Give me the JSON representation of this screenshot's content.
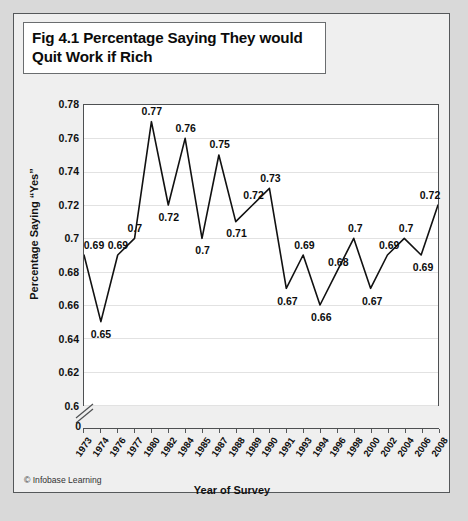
{
  "figure": {
    "title": "Fig 4.1 Percentage Saying They would Quit Work if Rich",
    "credit": "© Infobase Learning"
  },
  "chart_data": {
    "type": "line",
    "title": "Fig 4.1 Percentage Saying They would Quit Work if Rich",
    "xlabel": "Year of Survey",
    "ylabel": "Percentage Saying “Yes”",
    "categories": [
      "1973",
      "1974",
      "1976",
      "1977",
      "1980",
      "1982",
      "1984",
      "1985",
      "1987",
      "1988",
      "1989",
      "1990",
      "1991",
      "1993",
      "1994",
      "1996",
      "1998",
      "2000",
      "2002",
      "2004",
      "2006",
      "2008"
    ],
    "values": [
      0.69,
      0.65,
      0.69,
      0.7,
      0.77,
      0.72,
      0.76,
      0.7,
      0.75,
      0.71,
      0.72,
      0.73,
      0.67,
      0.69,
      0.66,
      0.68,
      0.7,
      0.67,
      0.69,
      0.7,
      0.69,
      0.72
    ],
    "point_labels": [
      "0.69",
      "0.65",
      "0.69",
      "0.7",
      "0.77",
      "0.72",
      "0.76",
      "0.7",
      "0.75",
      "0.71",
      "0.72",
      "0.73",
      "0.67",
      "0.69",
      "0.66",
      "0.68",
      "0.7",
      "0.67",
      "0.69",
      "0.7",
      "0.69",
      "0.72"
    ],
    "yticks": [
      "0.78",
      "0.76",
      "0.74",
      "0.72",
      "0.7",
      "0.68",
      "0.66",
      "0.64",
      "0.62",
      "0.6"
    ],
    "ytick_values": [
      0.78,
      0.76,
      0.74,
      0.72,
      0.7,
      0.68,
      0.66,
      0.64,
      0.62,
      0.6
    ],
    "ylim": [
      0.6,
      0.78
    ],
    "axis_break": true,
    "axis_break_label": "0",
    "grid": true,
    "legend": "none",
    "line_color": "#111111"
  }
}
